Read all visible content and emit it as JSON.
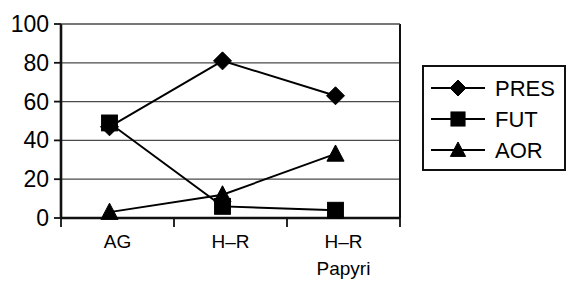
{
  "chart_data": {
    "type": "line",
    "title": "",
    "xlabel": "",
    "ylabel": "",
    "ylim": [
      0,
      100
    ],
    "yticks": [
      0,
      20,
      40,
      60,
      80,
      100
    ],
    "categories": [
      "AG",
      "H–R",
      "H–R Papyri"
    ],
    "category_lines": [
      [
        "AG"
      ],
      [
        "H–R"
      ],
      [
        "H–R",
        "Papyri"
      ]
    ],
    "grid": true,
    "legend_position": "right",
    "series": [
      {
        "name": "PRES",
        "marker": "diamond",
        "values": [
          47,
          81,
          63
        ]
      },
      {
        "name": "FUT",
        "marker": "square",
        "values": [
          49,
          6,
          4
        ]
      },
      {
        "name": "AOR",
        "marker": "triangle",
        "values": [
          3,
          12,
          33
        ]
      }
    ]
  },
  "axis": {
    "y_tick_labels": [
      "100",
      "80",
      "60",
      "40",
      "20",
      "0"
    ],
    "x_tick_labels_line1": [
      "AG",
      "H–R",
      "H–R"
    ],
    "x_tick_labels_line2": [
      "",
      "",
      "Papyri"
    ]
  },
  "legend": {
    "entries": [
      {
        "label": "PRES",
        "marker": "diamond"
      },
      {
        "label": "FUT",
        "marker": "square"
      },
      {
        "label": "AOR",
        "marker": "triangle"
      }
    ]
  },
  "colors": {
    "ink": "#000000",
    "grid": "#4a4a4a",
    "background": "#ffffff"
  }
}
